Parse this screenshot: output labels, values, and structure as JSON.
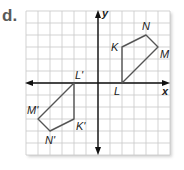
{
  "problem": {
    "label": "d."
  },
  "graph": {
    "grid": {
      "xmin": -6,
      "xmax": 6,
      "ymin": -6,
      "ymax": 6,
      "cell_px": 12,
      "origin_px": [
        98,
        83
      ],
      "grid_color": "#c8c8c8",
      "axis_color": "#111111",
      "shape_color": "#555555"
    },
    "axes": {
      "x_label": "x",
      "y_label": "y"
    },
    "figures": [
      {
        "name": "original",
        "vertices": [
          {
            "label": "K",
            "x": 2,
            "y": 3
          },
          {
            "label": "N",
            "x": 4,
            "y": 4
          },
          {
            "label": "M",
            "x": 5,
            "y": 3
          },
          {
            "label": "L",
            "x": 2,
            "y": 0
          }
        ]
      },
      {
        "name": "image",
        "vertices": [
          {
            "label": "K'",
            "x": -2,
            "y": -3
          },
          {
            "label": "N'",
            "x": -4,
            "y": -4
          },
          {
            "label": "M'",
            "x": -5,
            "y": -3
          },
          {
            "label": "L'",
            "x": -2,
            "y": 0
          }
        ]
      }
    ]
  }
}
